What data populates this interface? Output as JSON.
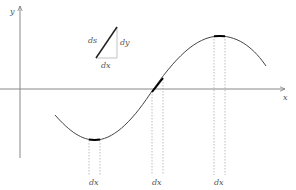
{
  "diagram": {
    "axes": {
      "x_label": "x",
      "y_label": "y"
    },
    "triangle": {
      "hypotenuse_label": "ds",
      "vertical_label": "dy",
      "horizontal_label": "dx"
    },
    "segments": [
      {
        "position": "minimum",
        "label": "dx"
      },
      {
        "position": "zero-crossing",
        "label": "dx"
      },
      {
        "position": "maximum",
        "label": "dx"
      }
    ],
    "colors": {
      "axis": "#777777",
      "curve": "#444444",
      "highlight": "#000000",
      "dashed": "#999999",
      "text": "#555555"
    }
  }
}
